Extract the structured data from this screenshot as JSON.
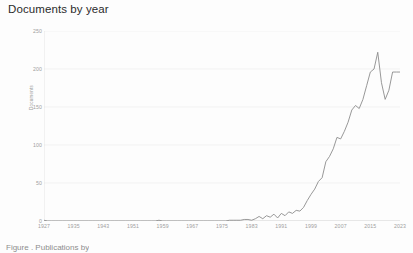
{
  "chart": {
    "title": "Documents by year",
    "caption": "Figure . Publications by"
  },
  "chart_data": {
    "type": "line",
    "title": "Documents by year",
    "xlabel": "",
    "ylabel": "Documents",
    "xlim": [
      1927,
      2023
    ],
    "ylim": [
      0,
      250
    ],
    "grid": true,
    "legend": false,
    "line_color": "#8c8c8c",
    "xticks": [
      1927,
      1935,
      1943,
      1951,
      1959,
      1967,
      1975,
      1983,
      1991,
      1999,
      2007,
      2015,
      2023
    ],
    "yticks": [
      0,
      50,
      100,
      150,
      200,
      250
    ],
    "x": [
      1927,
      1928,
      1929,
      1930,
      1931,
      1932,
      1933,
      1934,
      1935,
      1936,
      1937,
      1938,
      1939,
      1940,
      1941,
      1942,
      1943,
      1944,
      1945,
      1946,
      1947,
      1948,
      1949,
      1950,
      1951,
      1952,
      1953,
      1954,
      1955,
      1956,
      1957,
      1958,
      1959,
      1960,
      1961,
      1962,
      1963,
      1964,
      1965,
      1966,
      1967,
      1968,
      1969,
      1970,
      1971,
      1972,
      1973,
      1974,
      1975,
      1976,
      1977,
      1978,
      1979,
      1980,
      1981,
      1982,
      1983,
      1984,
      1985,
      1986,
      1987,
      1988,
      1989,
      1990,
      1991,
      1992,
      1993,
      1994,
      1995,
      1996,
      1997,
      1998,
      1999,
      2000,
      2001,
      2002,
      2003,
      2004,
      2005,
      2006,
      2007,
      2008,
      2009,
      2010,
      2011,
      2012,
      2013,
      2014,
      2015,
      2016,
      2017,
      2018,
      2019,
      2020,
      2021,
      2022,
      2023
    ],
    "y": [
      1,
      0,
      0,
      0,
      0,
      0,
      0,
      0,
      0,
      0,
      0,
      0,
      0,
      0,
      0,
      0,
      0,
      0,
      0,
      0,
      0,
      0,
      0,
      0,
      0,
      0,
      0,
      0,
      0,
      0,
      0,
      1,
      0,
      0,
      0,
      0,
      0,
      0,
      0,
      0,
      0,
      0,
      0,
      0,
      0,
      0,
      0,
      0,
      0,
      0,
      1,
      1,
      1,
      1,
      2,
      2,
      1,
      3,
      6,
      3,
      7,
      5,
      9,
      4,
      10,
      7,
      12,
      10,
      14,
      13,
      18,
      27,
      35,
      42,
      52,
      57,
      78,
      85,
      95,
      110,
      108,
      118,
      130,
      146,
      152,
      148,
      160,
      178,
      196,
      200,
      222,
      182,
      160,
      172,
      196,
      196,
      196
    ],
    "series": [
      {
        "name": "Documents",
        "values": [
          1,
          0,
          0,
          0,
          0,
          0,
          0,
          0,
          0,
          0,
          0,
          0,
          0,
          0,
          0,
          0,
          0,
          0,
          0,
          0,
          0,
          0,
          0,
          0,
          0,
          0,
          0,
          0,
          0,
          0,
          0,
          1,
          0,
          0,
          0,
          0,
          0,
          0,
          0,
          0,
          0,
          0,
          0,
          0,
          0,
          0,
          0,
          0,
          0,
          0,
          1,
          1,
          1,
          1,
          2,
          2,
          1,
          3,
          6,
          3,
          7,
          5,
          9,
          4,
          10,
          7,
          12,
          10,
          14,
          13,
          18,
          27,
          35,
          42,
          52,
          57,
          78,
          85,
          95,
          110,
          108,
          118,
          130,
          146,
          152,
          148,
          160,
          178,
          196,
          200,
          222,
          182,
          160,
          172,
          196,
          196,
          196
        ]
      }
    ]
  }
}
